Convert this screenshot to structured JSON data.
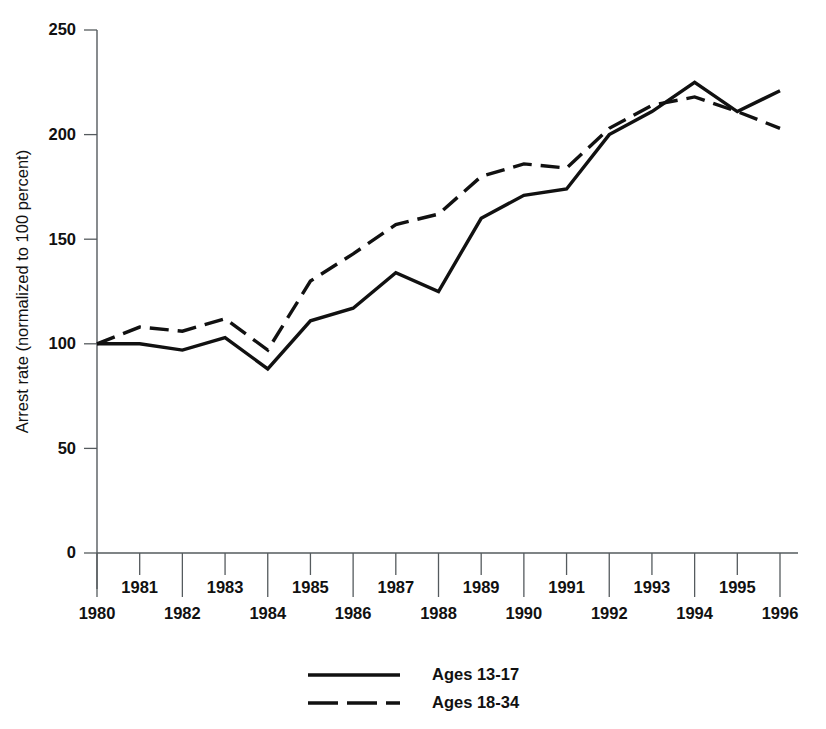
{
  "chart_data": {
    "type": "line",
    "title": "",
    "xlabel": "",
    "ylabel": "Arrest rate (normalized to 100 percent)",
    "x": [
      1980,
      1981,
      1982,
      1983,
      1984,
      1985,
      1986,
      1987,
      1988,
      1989,
      1990,
      1991,
      1992,
      1993,
      1994,
      1995,
      1996
    ],
    "xtick_labels": [
      "1980",
      "1981",
      "1982",
      "1983",
      "1984",
      "1985",
      "1986",
      "1987",
      "1988",
      "1989",
      "1990",
      "1991",
      "1992",
      "1993",
      "1994",
      "1995",
      "1996"
    ],
    "ytick_labels": [
      "0",
      "50",
      "100",
      "150",
      "200",
      "250"
    ],
    "yticks": [
      0,
      50,
      100,
      150,
      200,
      250
    ],
    "ylim": [
      0,
      250
    ],
    "xlim": [
      1980,
      1996
    ],
    "grid": false,
    "legend_position": "bottom-center",
    "series": [
      {
        "name": "Ages 13-17",
        "style": "solid",
        "color": "#111111",
        "values": [
          100,
          100,
          97,
          103,
          88,
          111,
          117,
          134,
          125,
          160,
          171,
          174,
          200,
          211,
          225,
          211,
          221
        ]
      },
      {
        "name": "Ages 18-34",
        "style": "dashed",
        "color": "#111111",
        "values": [
          100,
          108,
          106,
          112,
          97,
          130,
          143,
          157,
          162,
          180,
          186,
          184,
          203,
          214,
          218,
          211,
          203
        ]
      }
    ]
  },
  "legend": {
    "items": [
      {
        "label": "Ages 13-17",
        "style": "solid"
      },
      {
        "label": "Ages 18-34",
        "style": "dashed"
      }
    ]
  }
}
